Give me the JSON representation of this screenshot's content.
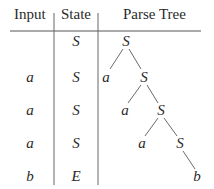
{
  "table": {
    "headers": {
      "input": "Input",
      "state": "State",
      "parse_tree": "Parse Tree"
    },
    "rows": [
      {
        "input": "",
        "state": "S"
      },
      {
        "input": "a",
        "state": "S"
      },
      {
        "input": "a",
        "state": "S"
      },
      {
        "input": "a",
        "state": "S"
      },
      {
        "input": "b",
        "state": "E"
      }
    ]
  },
  "parse_tree": {
    "nodes": [
      {
        "id": "n0",
        "label": "S"
      },
      {
        "id": "n1",
        "label": "a"
      },
      {
        "id": "n2",
        "label": "S"
      },
      {
        "id": "n3",
        "label": "a"
      },
      {
        "id": "n4",
        "label": "S"
      },
      {
        "id": "n5",
        "label": "a"
      },
      {
        "id": "n6",
        "label": "S"
      },
      {
        "id": "n7",
        "label": "b"
      }
    ],
    "edges": [
      [
        "n0",
        "n1"
      ],
      [
        "n0",
        "n2"
      ],
      [
        "n2",
        "n3"
      ],
      [
        "n2",
        "n4"
      ],
      [
        "n4",
        "n5"
      ],
      [
        "n4",
        "n6"
      ],
      [
        "n6",
        "n7"
      ]
    ]
  }
}
